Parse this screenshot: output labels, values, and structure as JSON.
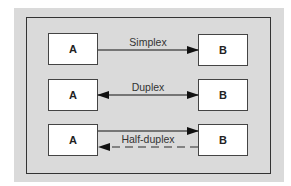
{
  "diagram": {
    "rows": [
      {
        "mode": "simplex",
        "label": "Simplex",
        "left_node": "A",
        "right_node": "B",
        "links": [
          {
            "from": "A",
            "to": "B",
            "style": "solid",
            "direction": "A-to-B"
          }
        ]
      },
      {
        "mode": "duplex",
        "label": "Duplex",
        "left_node": "A",
        "right_node": "B",
        "links": [
          {
            "from": "A",
            "to": "B",
            "style": "solid",
            "direction": "both"
          }
        ]
      },
      {
        "mode": "half-duplex",
        "label": "Half-duplex",
        "left_node": "A",
        "right_node": "B",
        "links": [
          {
            "from": "A",
            "to": "B",
            "style": "solid",
            "direction": "A-to-B"
          },
          {
            "from": "B",
            "to": "A",
            "style": "dashed",
            "direction": "B-to-A"
          }
        ]
      }
    ],
    "colors": {
      "panel": "#dadada",
      "frame": "#333333",
      "node_fill": "#ffffff",
      "arrow": "#111111",
      "dashed_line": "#666666",
      "label_text": "#333333"
    }
  }
}
